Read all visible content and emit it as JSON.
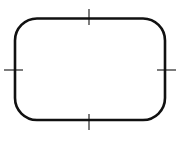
{
  "diagram": {
    "shape": "rounded-rectangle",
    "stroke_color": "#111111",
    "background_color": "#ffffff",
    "rect": {
      "x": 15,
      "y": 18.5,
      "width": 150,
      "height": 101.5,
      "radius": 22,
      "stroke_width": 2.6
    },
    "ticks": [
      {
        "position": "top",
        "x1": 89,
        "y1": 9,
        "x2": 89,
        "y2": 25
      },
      {
        "position": "right",
        "x1": 157,
        "y1": 70,
        "x2": 176,
        "y2": 70
      },
      {
        "position": "bottom",
        "x1": 89,
        "y1": 114,
        "x2": 89,
        "y2": 130
      },
      {
        "position": "left",
        "x1": 4,
        "y1": 70,
        "x2": 23,
        "y2": 70
      }
    ],
    "tick_stroke_width": 1.1
  }
}
